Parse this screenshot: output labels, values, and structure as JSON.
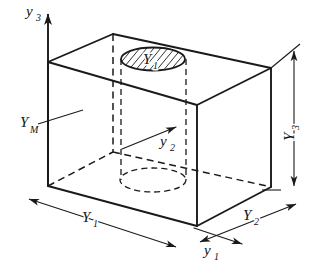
{
  "figure": {
    "background_color": "#ffffff",
    "line_color": "#1a1a1a",
    "width": 321,
    "height": 270
  },
  "axes": [
    {
      "id": "y3",
      "name": "vertical-axis",
      "label": "y",
      "subscript": "3",
      "direction": "up",
      "label_x": 26,
      "label_y": 16,
      "sub_x": 36,
      "sub_y": 21,
      "from": [
        48,
        186
      ],
      "to": [
        48,
        10
      ]
    },
    {
      "id": "y2",
      "name": "depth-axis",
      "label": "y",
      "subscript": "2",
      "direction": "up-right",
      "label_x": 160,
      "label_y": 146,
      "sub_x": 170,
      "sub_y": 151,
      "from": [
        122,
        149
      ],
      "to": [
        180,
        125
      ]
    },
    {
      "id": "y1",
      "name": "width-axis",
      "label": "y",
      "subscript": "1",
      "direction": "down-right",
      "label_x": 204,
      "label_y": 255,
      "sub_x": 214,
      "sub_y": 260,
      "from": [
        194,
        228
      ],
      "to": [
        246,
        245
      ]
    }
  ],
  "dimensions": [
    {
      "id": "Y1",
      "name": "dimension-width-front",
      "label": "Y",
      "subscript": "1",
      "label_x": 82,
      "label_y": 222,
      "sub_x": 93,
      "sub_y": 227,
      "from": [
        25,
        198
      ],
      "to": [
        180,
        248
      ],
      "arrows": "both"
    },
    {
      "id": "Y2",
      "name": "dimension-depth-right",
      "label": "Y",
      "subscript": "2",
      "label_x": 243,
      "label_y": 220,
      "sub_x": 254,
      "sub_y": 225,
      "from": [
        196,
        244
      ],
      "to": [
        300,
        202
      ],
      "arrows": "both"
    },
    {
      "id": "Y3",
      "name": "dimension-height-right",
      "label": "Y",
      "subscript": "3",
      "label_x": 287,
      "label_y": 138,
      "sub_x": 294,
      "sub_y": 144,
      "from": [
        294,
        47
      ],
      "to": [
        294,
        190
      ],
      "arrows": "both"
    }
  ],
  "callouts": [
    {
      "id": "YM",
      "name": "callout-material",
      "label": "Y",
      "subscript": "M",
      "label_x": 22,
      "label_y": 127,
      "sub_x": 32,
      "sub_y": 133,
      "leader_from": [
        38,
        124
      ],
      "leader_to": [
        83,
        110
      ]
    }
  ],
  "hole": {
    "name": "cylindrical-hole",
    "top_label": "Y",
    "top_subscript": "1",
    "label_x": 143,
    "label_y": 64,
    "sub_x": 153,
    "sub_y": 69,
    "top_ellipse": {
      "cx": 153,
      "cy": 59,
      "rx": 32,
      "ry": 11.5,
      "style": "hatched-solid"
    },
    "bottom_ellipse": {
      "cx": 153,
      "cy": 180,
      "rx": 33,
      "ry": 12,
      "style": "dashed-hidden"
    },
    "wall_left_x": 121,
    "wall_right_x": 186,
    "wall_top_y": 59,
    "wall_bottom_y": 180,
    "hatch_angle_deg": 50,
    "hatch_spacing": 7
  },
  "box": {
    "name": "rectangular-block",
    "vertices": {
      "top_left": [
        48,
        62
      ],
      "top_back": [
        113,
        34
      ],
      "top_right": [
        271,
        68
      ],
      "top_front": [
        197,
        105
      ],
      "bottom_left": [
        48,
        186
      ],
      "bottom_right": [
        271,
        187
      ],
      "bottom_front": [
        197,
        226
      ],
      "bottom_back_hidden": [
        113,
        152
      ]
    },
    "visible_edges": [
      [
        [
          48,
          62
        ],
        [
          113,
          34
        ]
      ],
      [
        [
          113,
          34
        ],
        [
          271,
          68
        ]
      ],
      [
        [
          271,
          68
        ],
        [
          197,
          105
        ]
      ],
      [
        [
          197,
          105
        ],
        [
          48,
          62
        ]
      ],
      [
        [
          48,
          62
        ],
        [
          48,
          186
        ]
      ],
      [
        [
          271,
          68
        ],
        [
          271,
          187
        ]
      ],
      [
        [
          197,
          105
        ],
        [
          197,
          226
        ]
      ],
      [
        [
          48,
          186
        ],
        [
          197,
          226
        ]
      ],
      [
        [
          197,
          226
        ],
        [
          271,
          187
        ]
      ]
    ],
    "hidden_edges": [
      [
        [
          48,
          186
        ],
        [
          113,
          152
        ]
      ],
      [
        [
          113,
          152
        ],
        [
          271,
          187
        ]
      ],
      [
        [
          113,
          34
        ],
        [
          113,
          152
        ]
      ]
    ]
  }
}
